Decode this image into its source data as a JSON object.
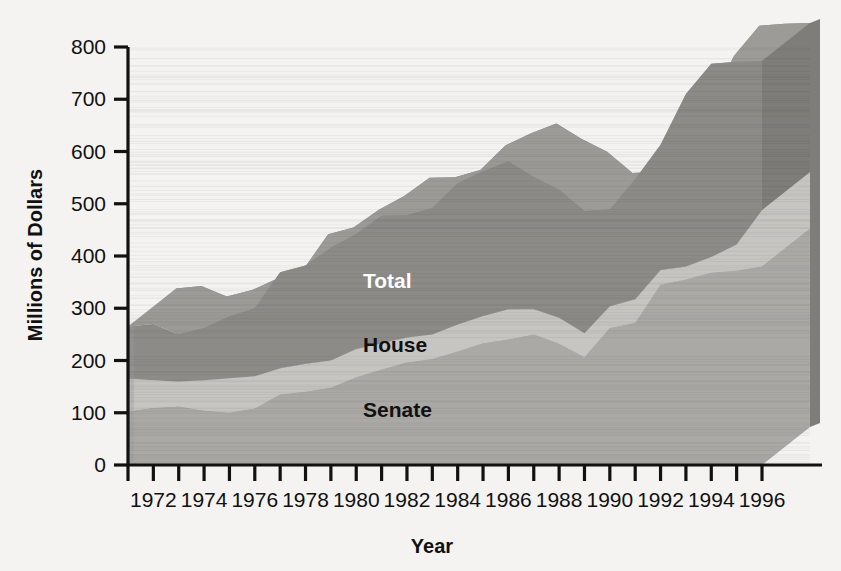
{
  "chart_data": {
    "type": "area",
    "title": "",
    "xlabel": "Year",
    "ylabel": "Millions of Dollars",
    "stacked": true,
    "three_d": true,
    "grid": false,
    "legend": "inline-labels",
    "xlim": [
      1971,
      1996
    ],
    "ylim": [
      0,
      800
    ],
    "ytick_values": [
      0,
      100,
      200,
      300,
      400,
      500,
      600,
      700,
      800
    ],
    "ytick_labels": [
      "0",
      "100",
      "200",
      "300",
      "400",
      "500",
      "600",
      "700",
      "800"
    ],
    "xtick_values": [
      1972,
      1974,
      1976,
      1978,
      1980,
      1982,
      1984,
      1986,
      1988,
      1990,
      1992,
      1994,
      1996
    ],
    "xtick_labels": [
      "1972",
      "1974",
      "1976",
      "1978",
      "1980",
      "1982",
      "1984",
      "1986",
      "1988",
      "1990",
      "1992",
      "1994",
      "1996"
    ],
    "x": [
      1971,
      1972,
      1973,
      1974,
      1975,
      1976,
      1977,
      1978,
      1979,
      1980,
      1981,
      1982,
      1983,
      1984,
      1985,
      1986,
      1987,
      1988,
      1989,
      1990,
      1991,
      1992,
      1993,
      1994,
      1995,
      1996
    ],
    "series": [
      {
        "name": "Senate",
        "color": "#aaa9a6",
        "top_face_color": "#bab9b6",
        "values": [
          103,
          110,
          112,
          104,
          100,
          108,
          135,
          140,
          148,
          168,
          183,
          196,
          203,
          217,
          233,
          240,
          250,
          232,
          206,
          262,
          272,
          345,
          355,
          368,
          372,
          380
        ]
      },
      {
        "name": "House",
        "color": "#c6c5c2",
        "top_face_color": "#d6d5d2",
        "values": [
          62,
          52,
          48,
          58,
          66,
          62,
          50,
          54,
          52,
          54,
          50,
          48,
          47,
          52,
          52,
          58,
          48,
          50,
          46,
          42,
          45,
          28,
          25,
          30,
          50,
          108
        ]
      },
      {
        "name": "Total",
        "color": "#8c8b88",
        "top_face_color": "#9c9b98",
        "values": [
          100,
          108,
          90,
          100,
          118,
          130,
          184,
          188,
          216,
          220,
          244,
          234,
          242,
          270,
          277,
          283,
          253,
          245,
          234,
          185,
          230,
          240,
          330,
          370,
          350,
          285
        ]
      }
    ],
    "stack_tops": {
      "Senate": [
        103,
        110,
        112,
        104,
        100,
        108,
        135,
        140,
        148,
        168,
        183,
        196,
        203,
        217,
        233,
        240,
        250,
        232,
        206,
        262,
        272,
        345,
        355,
        368,
        372,
        380
      ],
      "House": [
        165,
        162,
        160,
        162,
        166,
        170,
        185,
        194,
        200,
        222,
        233,
        244,
        250,
        269,
        285,
        298,
        298,
        282,
        252,
        304,
        317,
        373,
        380,
        398,
        422,
        488
      ],
      "Total": [
        265,
        270,
        250,
        262,
        284,
        300,
        369,
        382,
        416,
        442,
        477,
        478,
        492,
        539,
        562,
        581,
        551,
        527,
        486,
        489,
        547,
        613,
        710,
        768,
        772,
        773
      ]
    },
    "series_labels": [
      {
        "name": "Total",
        "text": "Total"
      },
      {
        "name": "House",
        "text": "House"
      },
      {
        "name": "Senate",
        "text": "Senate"
      }
    ]
  },
  "colors": {
    "background": "#f4f3f1",
    "axis": "#111111",
    "senate_front": "#aaa9a6",
    "senate_top": "#bab9b6",
    "house_front": "#c6c5c2",
    "house_top": "#d6d5d2",
    "total_front": "#8c8b88",
    "total_top": "#9c9b98",
    "side_face": "#7e7d7a"
  },
  "labels": {
    "y_axis_title": "Millions of Dollars",
    "x_axis_title": "Year",
    "total": "Total",
    "house": "House",
    "senate": "Senate"
  }
}
